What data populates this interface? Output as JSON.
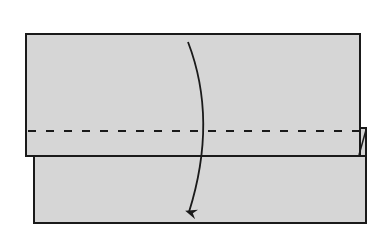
{
  "diagram": {
    "type": "origami-fold-step",
    "colors": {
      "background": "#ffffff",
      "paper_fill": "#d6d6d6",
      "stroke": "#1a1a1a"
    },
    "back_layer": {
      "x": 34,
      "y": 156,
      "width": 332,
      "height": 67
    },
    "front_layer": {
      "x": 26,
      "y": 34,
      "width": 334,
      "height": 122
    },
    "fold_line": {
      "style": "dashed",
      "y": 131,
      "x1": 28,
      "x2": 362,
      "dash": "8 10"
    },
    "fold_arrow": {
      "direction": "down",
      "path": "M 188 42 Q 218 120 189 212",
      "head_at": [
        189,
        216
      ]
    },
    "corner_flap": {
      "points": "360,128 366,128 360,154"
    }
  }
}
